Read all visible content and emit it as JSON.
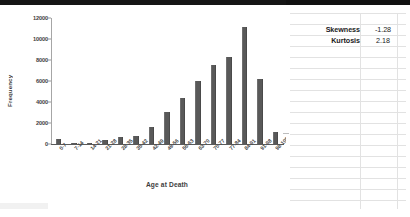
{
  "chart_data": {
    "type": "bar",
    "title": "",
    "xlabel": "Age at Death",
    "ylabel": "Frequency",
    "ylim": [
      0,
      12000
    ],
    "yticks": [
      0,
      2000,
      4000,
      6000,
      8000,
      10000,
      12000
    ],
    "ytick_labels": [
      "0",
      "2000",
      "4000",
      "6000",
      "8000",
      "10000",
      "12000"
    ],
    "grid": false,
    "legend": "none",
    "bar_color": "#595959",
    "categories": [
      "0-7",
      "7-14",
      "14-21",
      "21-28",
      "28-35",
      "35-42",
      "42-49",
      "49-56",
      "56-63",
      "63-70",
      "70-77",
      "77-84",
      "84-91",
      "91-98",
      "98-105"
    ],
    "values": [
      480,
      30,
      90,
      430,
      650,
      740,
      1650,
      3080,
      4420,
      6000,
      7520,
      8250,
      11150,
      6200,
      1100
    ]
  },
  "stats_table": {
    "rows": [
      {
        "label": "Skewness",
        "value": "-1.28"
      },
      {
        "label": "Kurtosis",
        "value": "2.18"
      }
    ]
  }
}
